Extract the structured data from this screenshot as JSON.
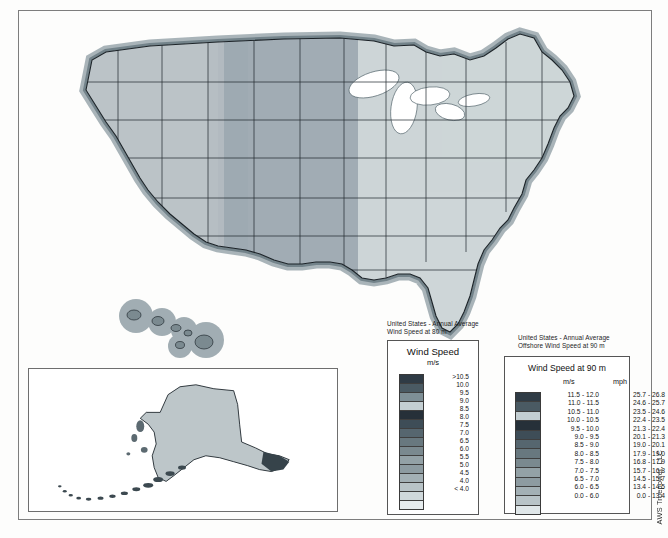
{
  "document": {
    "title": "United States - Annual Average Wind Speed Map",
    "credit": "AWS Truepower, LLC"
  },
  "main_map": {
    "name": "conus-wind-resource-map",
    "region": "Contiguous United States"
  },
  "alaska_inset": {
    "name": "alaska-wind-resource-inset",
    "region": "Alaska"
  },
  "hawaii_inset": {
    "name": "hawaii-wind-resource-inset",
    "region": "Hawaii"
  },
  "legend_onshore": {
    "caption": "United States - Annual Average\nWind Speed at 80 m",
    "title": "Wind Speed",
    "subtitle": "m/s",
    "entries": [
      {
        "label": ">10.5",
        "color": "#2f3b45"
      },
      {
        "label": "10.0",
        "color": "#4a5a63"
      },
      {
        "label": "9.5",
        "color": "#7e8f96"
      },
      {
        "label": "9.0",
        "color": "#c3ced2"
      },
      {
        "label": "8.5",
        "color": "#263039"
      },
      {
        "label": "8.0",
        "color": "#3e4d57"
      },
      {
        "label": "7.5",
        "color": "#56666f"
      },
      {
        "label": "7.0",
        "color": "#68787f"
      },
      {
        "label": "6.5",
        "color": "#7a898f"
      },
      {
        "label": "6.0",
        "color": "#93a1a6"
      },
      {
        "label": "5.5",
        "color": "#8d9ba1"
      },
      {
        "label": "5.0",
        "color": "#a3b0b5"
      },
      {
        "label": "4.5",
        "color": "#b8c3c7"
      },
      {
        "label": "4.0",
        "color": "#cfd8db"
      },
      {
        "label": "< 4.0",
        "color": "#e6ecee"
      }
    ]
  },
  "legend_offshore": {
    "caption": "United States - Annual Average\nOffshore Wind Speed at 90 m",
    "title": "Wind Speed at 90 m",
    "col_ms": "m/s",
    "col_mph": "mph",
    "entries": [
      {
        "ms": "11.5 - 12.0",
        "mph": "25.7 - 26.8",
        "color": "#2f3b45"
      },
      {
        "ms": "11.0 - 11.5",
        "mph": "24.6 - 25.7",
        "color": "#4a5a63"
      },
      {
        "ms": "10.5 - 11.0",
        "mph": "23.5 - 24.6",
        "color": "#c3ced2"
      },
      {
        "ms": "10.0 - 10.5",
        "mph": "22.4 - 23.5",
        "color": "#263039"
      },
      {
        "ms": "9.5 - 10.0",
        "mph": "21.3 - 22.4",
        "color": "#3e4d57"
      },
      {
        "ms": "9.0 -  9.5",
        "mph": "20.1 - 21.3",
        "color": "#56666f"
      },
      {
        "ms": "8.5 -  9.0",
        "mph": "19.0 - 20.1",
        "color": "#68787f"
      },
      {
        "ms": "8.0 -  8.5",
        "mph": "17.9 - 19.0",
        "color": "#7a898f"
      },
      {
        "ms": "7.5 -  8.0",
        "mph": "16.8 - 17.9",
        "color": "#93a1a6"
      },
      {
        "ms": "7.0 -  7.5",
        "mph": "15.7 - 16.8",
        "color": "#8d9ba1"
      },
      {
        "ms": "6.5 -  7.0",
        "mph": "14.5 - 15.7",
        "color": "#a3b0b5"
      },
      {
        "ms": "6.0 -  6.5",
        "mph": "13.4 - 14.5",
        "color": "#b8c3c7"
      },
      {
        "ms": "0.0 -  6.0",
        "mph": "0.0 - 13.4",
        "color": "#dfe6e8"
      }
    ]
  }
}
